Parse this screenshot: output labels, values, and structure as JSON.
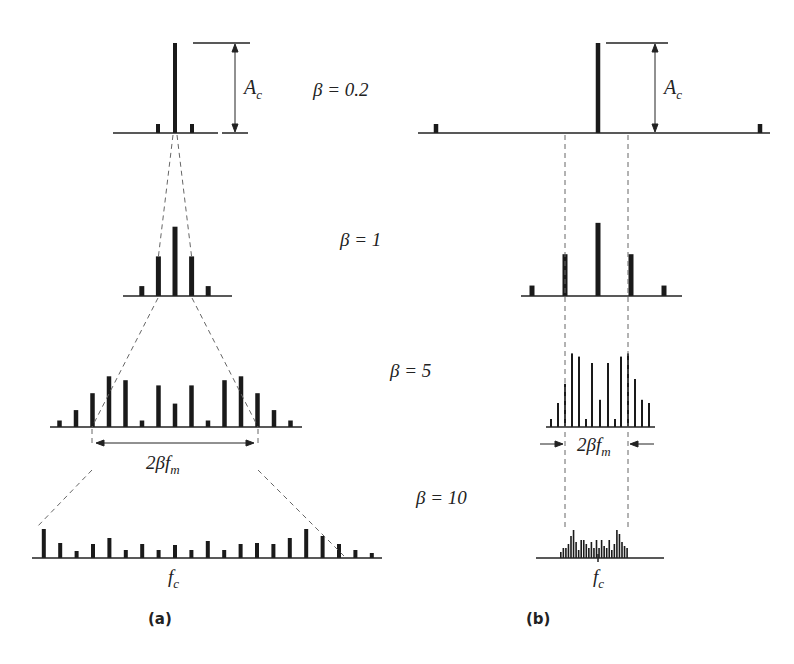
{
  "figure": {
    "panels": [
      {
        "id": "a",
        "label": "(a)",
        "description": "FM spectra, constant modulating frequency"
      },
      {
        "id": "b",
        "label": "(b)",
        "description": "FM spectra, constant deviation"
      }
    ],
    "beta_labels": [
      "β = 0.2",
      "β = 1",
      "β = 5",
      "β = 10"
    ],
    "amplitude_label": "A",
    "amplitude_sub": "c",
    "bandwidth_label": "2βf",
    "bandwidth_sub": "m",
    "carrier_label": "f",
    "carrier_sub": "c",
    "colors": {
      "bar": "#1a1a1a",
      "axis": "#222222",
      "dash": "#666666"
    }
  },
  "chart_data": [
    {
      "type": "bar",
      "title": "(a) β = 0.2",
      "x": [
        -1,
        0,
        1
      ],
      "values": [
        0.1,
        1.0,
        0.1
      ]
    },
    {
      "type": "bar",
      "title": "(a) β = 1",
      "x": [
        -2,
        -1,
        0,
        1,
        2
      ],
      "values": [
        0.11,
        0.44,
        0.77,
        0.44,
        0.11
      ]
    },
    {
      "type": "bar",
      "title": "(a) β = 5",
      "x": [
        -7,
        -6,
        -5,
        -4,
        -3,
        -2,
        -1,
        0,
        1,
        2,
        3,
        4,
        5,
        6,
        7
      ],
      "values": [
        0.05,
        0.13,
        0.26,
        0.39,
        0.36,
        0.05,
        0.32,
        0.18,
        0.32,
        0.05,
        0.36,
        0.39,
        0.26,
        0.13,
        0.05
      ]
    },
    {
      "type": "bar",
      "title": "(a) β = 10",
      "x": [
        -8,
        -7,
        -6,
        -5,
        -4,
        -3,
        -2,
        -1,
        0,
        1,
        2,
        3,
        4,
        5,
        6,
        7,
        8,
        9,
        10,
        11,
        12
      ],
      "values": [
        0.29,
        0.15,
        0.07,
        0.14,
        0.2,
        0.08,
        0.14,
        0.08,
        0.13,
        0.08,
        0.17,
        0.08,
        0.14,
        0.15,
        0.14,
        0.2,
        0.29,
        0.22,
        0.14,
        0.08,
        0.05
      ]
    },
    {
      "type": "bar",
      "title": "(b) β = 0.2",
      "x": [
        -1,
        0,
        1
      ],
      "values": [
        0.1,
        1.0,
        0.1
      ]
    },
    {
      "type": "bar",
      "title": "(b) β = 1",
      "x": [
        -2,
        -1,
        0,
        1,
        2
      ],
      "values": [
        0.11,
        0.44,
        0.77,
        0.44,
        0.11
      ]
    }
  ]
}
